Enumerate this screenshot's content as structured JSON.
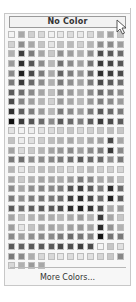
{
  "palette": {
    "no_color_label": "No Color",
    "more_colors_label": "More Colors...",
    "columns": 12,
    "swatches": [
      "#f4f4f4",
      "#a9a9a9",
      "#d0d0d0",
      "#d8d8d8",
      "#f1f1f1",
      "#e7e7e7",
      "#dcdcdc",
      "#e9e9e9",
      "#d8d8d8",
      "#b4b4b4",
      "#a1a1a1",
      "#c6c6c6",
      "#d2d2d2",
      "#8e8e8e",
      "#a8a8a8",
      "#c4c4c4",
      "#e4e4e4",
      "#c1c1c1",
      "#b9b9b9",
      "#cfcfcf",
      "#b5b5b5",
      "#8f8f8f",
      "#8a8a8a",
      "#9c9c9c",
      "#b0b0b0",
      "#3e3e3e",
      "#7c7c7c",
      "#a6a6a6",
      "#c8c8c8",
      "#909090",
      "#9e9e9e",
      "#b0b0b0",
      "#8f8f8f",
      "#4e4e4e",
      "#5a5a5a",
      "#6b6b6b",
      "#9b9b9b",
      "#2e2e2e",
      "#575757",
      "#8c8c8c",
      "#b8b8b8",
      "#727272",
      "#8b8b8b",
      "#a1a1a1",
      "#757575",
      "#3a3a3a",
      "#454545",
      "#575757",
      "#8a8a8a",
      "#1f1f1f",
      "#4a4a4a",
      "#7c7c7c",
      "#aaaaaa",
      "#646464",
      "#7e7e7e",
      "#969696",
      "#686868",
      "#2f2f2f",
      "#3c3c3c",
      "#4b4b4b",
      "#7a7a7a",
      "#3a3a3a",
      "#6a6a6a",
      "#8c8c8c",
      "#b0b0b0",
      "#7a7a7a",
      "#8f8f8f",
      "#a3a3a3",
      "#7b7b7b",
      "#4a4a4a",
      "#5b5b5b",
      "#6d6d6d",
      "#5a5a5a",
      "#6e6e6e",
      "#8a8a8a",
      "#a5a5a5",
      "#c0c0c0",
      "#8a8a8a",
      "#9a9a9a",
      "#adadad",
      "#8a8a8a",
      "#6a6a6a",
      "#7a7a7a",
      "#8b8b8b",
      "#4a4a4a",
      "#868686",
      "#9f9f9f",
      "#b5b5b5",
      "#d0d0d0",
      "#9a9a9a",
      "#a7a7a7",
      "#b9b9b9",
      "#989898",
      "#7f7f7f",
      "#8a8a8a",
      "#9b9b9b",
      "#2f2f2f",
      "#5e5e5e",
      "#7d7d7d",
      "#9a9a9a",
      "#b7b7b7",
      "#7a7a7a",
      "#8a8a8a",
      "#9d9d9d",
      "#7a7a7a",
      "#5a5a5a",
      "#696969",
      "#7a7a7a",
      "#0f0f0f",
      "#3a3a3a",
      "#555555",
      "#6a6a6a",
      "#8a8a8a",
      "#5a5a5a",
      "#6a6a6a",
      "#7d7d7d",
      "#5c5c5c",
      "#3c3c3c",
      "#4c4c4c",
      "#5c5c5c",
      "#e2e2e2",
      "#f2f2f2",
      "#eeeeee",
      "#e2e2e2",
      "#dadada",
      "#cfcfcf",
      "#c5c5c5",
      "#d6d6d6",
      "#cfcfcf",
      "#c7c7c7",
      "#bdbdbd",
      "#c6c6c6",
      "#c2c2c2",
      "#ececec",
      "#dfdfdf",
      "#cdcdcd",
      "#bdbdbd",
      "#b3b3b3",
      "#a7a7a7",
      "#bcbcbc",
      "#a7a7a7",
      "#9f9f9f",
      "#4a4a4a",
      "#a7a7a7",
      "#a3a3a3",
      "#d9d9d9",
      "#c8c8c8",
      "#b4b4b4",
      "#a2a2a2",
      "#969696",
      "#8a8a8a",
      "#9f9f9f",
      "#8a8a8a",
      "#7e7e7e",
      "#3a3a3a",
      "#8a8a8a",
      "#7a7a7a",
      "#6f6f6f",
      "#8c8c8c",
      "#8c8c8c",
      "#868686",
      "#7b7b7b",
      "#6e6e6e",
      "#5c5c5c",
      "#696969",
      "#6a6a6a",
      "#8d8d8d",
      "#7a7a7a",
      "#b5b5b5",
      "#e3e3e3",
      "#cbcbcb",
      "#bcbcbc",
      "#bdbdbd",
      "#cdcdcd",
      "#d4d4d4",
      "#c8c8c8",
      "#b7b7b7",
      "#cdcdcd",
      "#cfcfcf",
      "#d4d4d4",
      "#a9a9a9",
      "#cacaca",
      "#b2b2b2",
      "#a4a4a4",
      "#a6a6a6",
      "#acacac",
      "#9c9c9c",
      "#7d7d7d",
      "#888888",
      "#a9a9a9",
      "#a9a9a9",
      "#c0c0c0",
      "#8c8c8c",
      "#a7a7a7",
      "#8f8f8f",
      "#858585",
      "#898989",
      "#7e7e7e",
      "#555555",
      "#3e3e3e",
      "#5a5a5a",
      "#7d7d7d",
      "#2c2c2c",
      "#6a6a6a",
      "#7a7a7a",
      "#8f8f8f",
      "#7d7d7d",
      "#757575",
      "#797979",
      "#6c6c6c",
      "#3e3e3e",
      "#2b2b2b",
      "#484848",
      "#6b6b6b",
      "#1f1f1f",
      "#595959",
      "#5a5a5a",
      "#6c6c6c",
      "#5e5e5e",
      "#585858",
      "#5a5a5a",
      "#4a4a4a",
      "#2b2b2b",
      "#1f1f1f",
      "#333333",
      "#505050",
      "#aaaaaa",
      "#9c9c9c",
      "#a5a5a5",
      "#c3c3c3",
      "#b2b2b2",
      "#a6a6a6",
      "#acacac",
      "#b8b8b8",
      "#a9a9a9",
      "#9a9a9a",
      "#b2b2b2",
      "#3c3c3c",
      "#a7a7a7",
      "#c6c6c6",
      "#9f9f9f",
      "#e4e4e4",
      "#c4c4c4",
      "#a6a6a6",
      "#a4a4a4",
      "#b0b0b0",
      "#a0a0a0",
      "#999999",
      "#a5a5a5",
      "#2a2a2a",
      "#949494",
      "#b2b2b2",
      "#8a8a8a",
      "#9f9f9f",
      "#8f8f8f",
      "#8a8a8a",
      "#8a8a8a",
      "#7b7b7b",
      "#6c6c6c",
      "#767676",
      "#838383",
      "#121212",
      "#757575",
      "#7a7a7a",
      "#5a5a5a",
      "#626262",
      "#5a5a5a",
      "#5a5a5a",
      "#5a5a5a",
      "#4a4a4a",
      "#505050",
      "#3f3f3f",
      "#4c4c4c",
      "#f4f4f4",
      "#c6c6c6",
      "#e0e0e0",
      "#7a7a7a",
      "#8a8a8a",
      "#aeaeae",
      "#d8d8d8",
      "#d8d8d8",
      "#e6e6e6",
      "#dcdcdc",
      "#e8e8e8",
      "#e0e0e0",
      "#d6d6d6",
      "#c8c8c8",
      "#888888",
      "#d8d8d8",
      "#b0b0b0",
      "#9a9a9a",
      "#a8a8a8"
    ]
  },
  "cursor": {
    "icon": "arrow-pointer-icon"
  }
}
